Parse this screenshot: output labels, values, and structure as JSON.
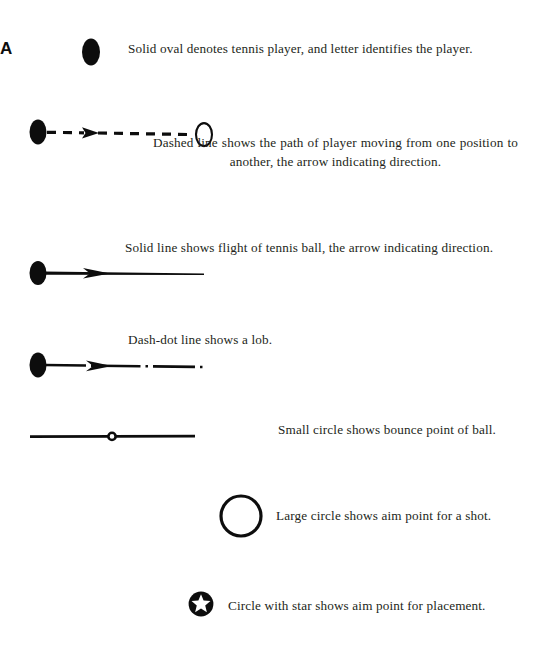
{
  "page": {
    "background_color": "#ffffff",
    "ink_color": "#231f20"
  },
  "legend": {
    "rows": [
      {
        "id": "player",
        "symbol_name": "solid-oval-player-marker",
        "player_letter": "A",
        "caption": "Solid oval denotes tennis player, and letter identifies the player."
      },
      {
        "id": "movement",
        "symbol_name": "dashed-line-with-arrow-and-hollow-oval",
        "caption_line_1": "Dashed line shows the path of player moving",
        "caption_line_2": "from one position to another, the arrow indicating direction.",
        "caption": "Dashed line shows the path of player moving from one position to another, the arrow indicating direction."
      },
      {
        "id": "ball-flight",
        "symbol_name": "solid-line-with-arrow",
        "caption": "Solid line shows flight of tennis ball, the arrow indicating direction."
      },
      {
        "id": "lob",
        "symbol_name": "dash-dot-line-with-arrow",
        "caption": "Dash-dot line shows a lob."
      },
      {
        "id": "bounce",
        "symbol_name": "small-circle-bounce-point",
        "caption": "Small circle shows bounce point of ball."
      },
      {
        "id": "aim",
        "symbol_name": "large-circle-aim-point",
        "caption": "Large circle shows aim point for a shot."
      },
      {
        "id": "placement",
        "symbol_name": "circle-with-star-placement-point",
        "caption": "Circle with star shows aim point for placement."
      }
    ]
  }
}
